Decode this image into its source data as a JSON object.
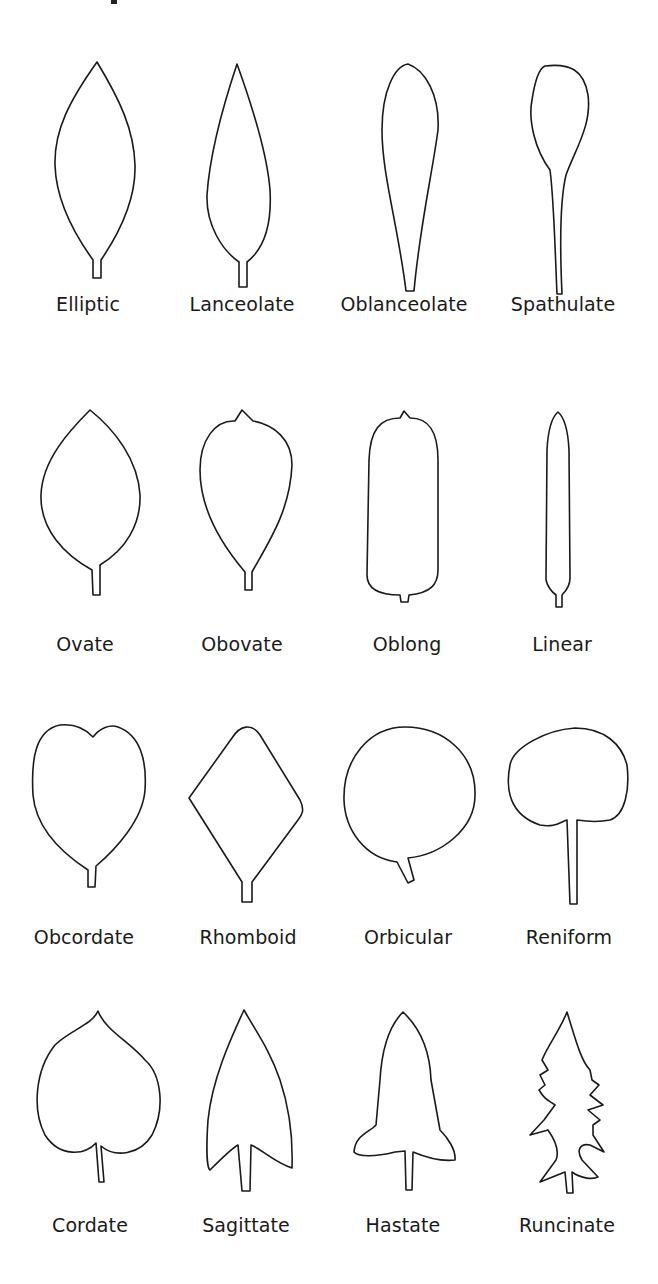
{
  "figure": {
    "rows": [
      {
        "leaves": [
          {
            "name": "Elliptic"
          },
          {
            "name": "Lanceolate"
          },
          {
            "name": "Oblanceolate"
          },
          {
            "name": "Spathulate"
          }
        ]
      },
      {
        "leaves": [
          {
            "name": "Ovate"
          },
          {
            "name": "Obovate"
          },
          {
            "name": "Oblong"
          },
          {
            "name": "Linear"
          }
        ]
      },
      {
        "leaves": [
          {
            "name": "Obcordate"
          },
          {
            "name": "Rhomboid"
          },
          {
            "name": "Orbicular"
          },
          {
            "name": "Reniform"
          }
        ]
      },
      {
        "leaves": [
          {
            "name": "Cordate"
          },
          {
            "name": "Sagittate"
          },
          {
            "name": "Hastate"
          },
          {
            "name": "Runcinate"
          }
        ]
      }
    ]
  },
  "colors": {
    "stroke": "#1a1a1a",
    "background": "#ffffff"
  }
}
